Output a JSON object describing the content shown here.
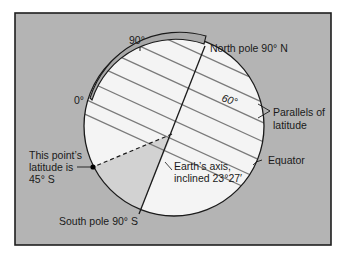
{
  "figure": {
    "colors": {
      "background_panel": "#b4b4b4",
      "frame": "#1e1e1e",
      "globe_fill": "#f4f4f4",
      "wedge_fill": "#d2d2d2",
      "parallels": "#7a7a7a",
      "outline": "#1a1a1a",
      "arc_band": "#a8a8a8"
    },
    "labels": {
      "deg_90": "90°",
      "deg_0": "0°",
      "deg_60": "60°",
      "north_pole": "North pole 90° N",
      "parallels_line1": "Parallels of",
      "parallels_line2": "latitude",
      "equator": "Equator",
      "axis_line1": "Earth’s axis,",
      "axis_line2": "inclined 23°27′",
      "point_line1": "This point’s",
      "point_line2": "latitude is",
      "point_line3": "45° S",
      "south_pole": "South pole 90° S"
    }
  }
}
